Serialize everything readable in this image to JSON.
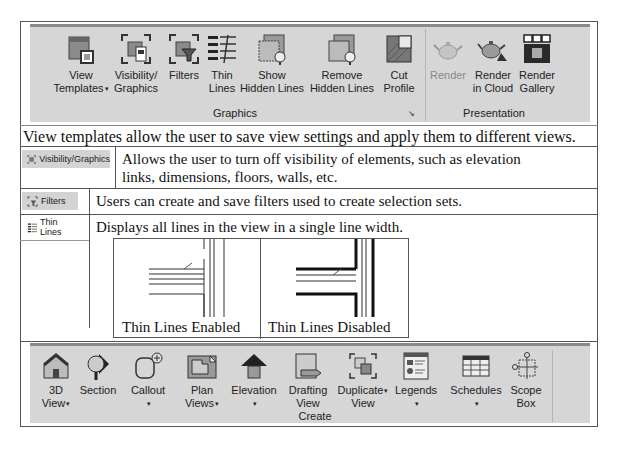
{
  "graphics_ribbon": {
    "items": [
      {
        "label_line1": "View",
        "label_line2": "Templates",
        "dropdown": true,
        "icon": "view-templates-icon"
      },
      {
        "label_line1": "Visibility/",
        "label_line2": "Graphics",
        "dropdown": false,
        "icon": "visibility-graphics-icon"
      },
      {
        "label_line1": "Filters",
        "label_line2": "",
        "dropdown": false,
        "icon": "filters-icon"
      },
      {
        "label_line1": "Thin",
        "label_line2": "Lines",
        "dropdown": false,
        "icon": "thin-lines-icon"
      },
      {
        "label_line1": "Show",
        "label_line2": "Hidden Lines",
        "dropdown": false,
        "icon": "show-hidden-lines-icon"
      },
      {
        "label_line1": "Remove",
        "label_line2": "Hidden Lines",
        "dropdown": false,
        "icon": "remove-hidden-lines-icon"
      },
      {
        "label_line1": "Cut",
        "label_line2": "Profile",
        "dropdown": false,
        "icon": "cut-profile-icon"
      },
      {
        "label_line1": "Render",
        "label_line2": "",
        "dropdown": false,
        "disabled": true,
        "icon": "render-icon"
      },
      {
        "label_line1": "Render",
        "label_line2": "in Cloud",
        "dropdown": false,
        "icon": "render-cloud-icon"
      },
      {
        "label_line1": "Render",
        "label_line2": "Gallery",
        "dropdown": false,
        "icon": "render-gallery-icon"
      }
    ],
    "groups": {
      "graphics": "Graphics",
      "presentation": "Presentation"
    },
    "dialog_launcher": "↘"
  },
  "rows": {
    "view_templates": "View templates allow the user to save view settings and apply them to different views.",
    "visibility": {
      "chip": "Visibility/Graphics",
      "text_line1": "Allows the user to turn off visibility of elements, such as elevation",
      "text_line2": "links, dimensions, floors, walls, etc."
    },
    "filters": {
      "chip": "Filters",
      "text": "Users can create and save filters used to create selection sets."
    },
    "thin_lines": {
      "chip": "Thin Lines",
      "text": "Displays all lines in the view in a single line width.",
      "caption_enabled": "Thin Lines Enabled",
      "caption_disabled": "Thin Lines Disabled"
    }
  },
  "create_ribbon": {
    "items": [
      {
        "label_line1": "3D",
        "label_line2": "View",
        "dropdown": true,
        "icon": "3d-view-icon"
      },
      {
        "label_line1": "Section",
        "label_line2": "",
        "dropdown": false,
        "icon": "section-icon"
      },
      {
        "label_line1": "Callout",
        "label_line2": "",
        "dropdown": true,
        "icon": "callout-icon"
      },
      {
        "label_line1": "Plan",
        "label_line2": "Views",
        "dropdown": true,
        "icon": "plan-views-icon"
      },
      {
        "label_line1": "Elevation",
        "label_line2": "",
        "dropdown": true,
        "icon": "elevation-icon"
      },
      {
        "label_line1": "Drafting",
        "label_line2": "View",
        "dropdown": false,
        "icon": "drafting-view-icon"
      },
      {
        "label_line1": "Duplicate",
        "label_line2": "View",
        "dropdown": true,
        "icon": "duplicate-view-icon"
      },
      {
        "label_line1": "Legends",
        "label_line2": "",
        "dropdown": true,
        "icon": "legends-icon"
      },
      {
        "label_line1": "Schedules",
        "label_line2": "",
        "dropdown": true,
        "icon": "schedules-icon"
      },
      {
        "label_line1": "Scope",
        "label_line2": "Box",
        "dropdown": false,
        "icon": "scope-box-icon"
      }
    ],
    "group": "Create"
  }
}
